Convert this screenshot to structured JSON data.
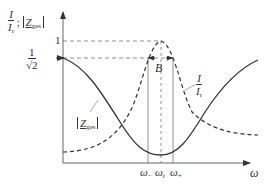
{
  "diagram": {
    "y_axis": {
      "label_fraction_num": "I",
      "label_fraction_den": "I",
      "label_fraction_den_sub": "r",
      "label_separator": ";",
      "label_abs_symbol": "Z",
      "label_abs_sub": "ges",
      "ticks": {
        "one": "1",
        "inv_sqrt2_num": "1",
        "inv_sqrt2_den": "√2"
      }
    },
    "x_axis": {
      "label": "ω",
      "ticks": [
        {
          "symbol": "ω",
          "sub": "−"
        },
        {
          "symbol": "ω",
          "sub": "r"
        },
        {
          "symbol": "ω",
          "sub": "+"
        }
      ]
    },
    "bandwidth_label": "B",
    "curves": [
      {
        "name": "current-ratio",
        "style": "dashed",
        "label_num": "I",
        "label_den": "I",
        "label_den_sub": "r"
      },
      {
        "name": "impedance-magnitude",
        "style": "solid",
        "label_symbol": "Z",
        "label_sub": "ges"
      }
    ],
    "colors": {
      "stroke": "#333333",
      "guide": "#888888",
      "background": "#ffffff"
    }
  }
}
